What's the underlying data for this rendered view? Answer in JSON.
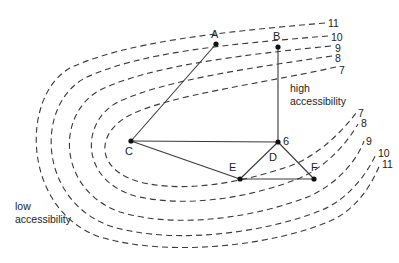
{
  "nodes": [
    {
      "id": "A",
      "label": "A"
    },
    {
      "id": "B",
      "label": "B"
    },
    {
      "id": "C",
      "label": "C"
    },
    {
      "id": "D",
      "label": "D",
      "extra_label": "6"
    },
    {
      "id": "E",
      "label": "E"
    },
    {
      "id": "F",
      "label": "F"
    }
  ],
  "edges": [
    [
      "A",
      "C"
    ],
    [
      "B",
      "D"
    ],
    [
      "C",
      "D"
    ],
    [
      "C",
      "E"
    ],
    [
      "D",
      "E"
    ],
    [
      "D",
      "F"
    ],
    [
      "E",
      "F"
    ]
  ],
  "contours": [
    {
      "value": "7",
      "top_label": "7",
      "bottom_label": "7"
    },
    {
      "value": "8",
      "top_label": "8",
      "bottom_label": "8"
    },
    {
      "value": "9",
      "top_label": "9",
      "bottom_label": "9"
    },
    {
      "value": "10",
      "top_label": "10",
      "bottom_label": "10"
    },
    {
      "value": "11",
      "top_label": "11",
      "bottom_label": "11"
    }
  ],
  "annotations": {
    "high": [
      "high",
      "accessibility"
    ],
    "low": [
      "low",
      "accessibility"
    ]
  }
}
